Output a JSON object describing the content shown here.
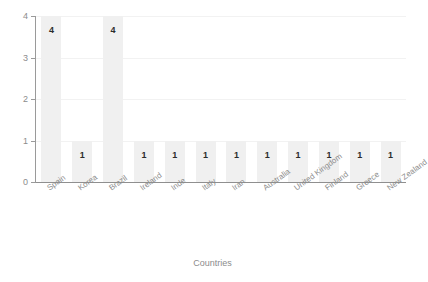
{
  "chart_data": {
    "type": "bar",
    "title": "",
    "subtitle": "",
    "xlabel": "Countries",
    "ylabel": "",
    "ylim": [
      0,
      4
    ],
    "yticks": [
      "0",
      "1",
      "2",
      "3",
      "4"
    ],
    "grid": true,
    "legend": false,
    "legend_position": "none",
    "orientation": "vertical",
    "categories": [
      "Spain",
      "Korea",
      "Brazil",
      "Ireland",
      "Inde",
      "Italy",
      "Iran",
      "Australia",
      "United Kingdom",
      "Finland",
      "Greece",
      "New Zealand"
    ],
    "values": [
      4,
      1,
      4,
      1,
      1,
      1,
      1,
      1,
      1,
      1,
      1,
      1
    ],
    "value_labels": [
      "4",
      "1",
      "4",
      "1",
      "1",
      "1",
      "1",
      "1",
      "1",
      "1",
      "1",
      "1"
    ]
  },
  "style": {
    "background": "#ffffff",
    "bar_color": "#f0f0f0",
    "gridline_color": "#f2f2f2",
    "axis_color": "#8f8f8f",
    "tick_label_color": "#8c8c8c",
    "value_label_color": "#2b2b2b"
  },
  "watermark": {
    "text": " "
  }
}
